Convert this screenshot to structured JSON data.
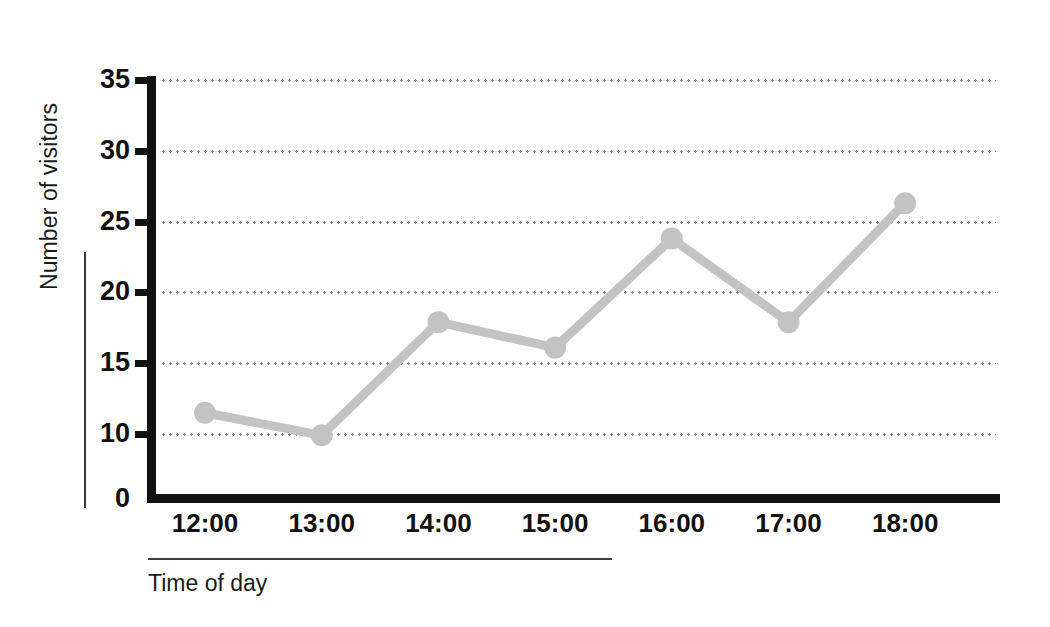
{
  "chart_data": {
    "type": "line",
    "title": "",
    "subtitle": "",
    "xlabel": "Time of day",
    "ylabel": "Number of visitors",
    "categories": [
      "12:00",
      "13:00",
      "14:00",
      "15:00",
      "16:00",
      "17:00",
      "18:00"
    ],
    "series": [
      {
        "name": "Number of visitors",
        "values": [
          11.5,
          9.8,
          17.9,
          16.1,
          23.8,
          17.9,
          26.3
        ],
        "color": "#c3c3c3",
        "marker": "circle"
      }
    ],
    "ylim": [
      0,
      35
    ],
    "y_ticks": [
      0,
      10,
      15,
      20,
      25,
      30,
      35
    ],
    "y_tick_labels": [
      "0",
      "10",
      "15",
      "20",
      "25",
      "30",
      "35"
    ],
    "y_axis_broken": true,
    "x_tick_labels": [
      "12:00",
      "13:00",
      "14:00",
      "15:00",
      "16:00",
      "17:00",
      "18:00"
    ],
    "grid": true,
    "grid_style": "dotted-horizontal",
    "legend": "none",
    "annotations": []
  },
  "axis": {
    "y_title": "Number of visitors",
    "x_title": "Time of day"
  },
  "colors": {
    "line": "#c3c3c3",
    "marker": "#c3c3c3",
    "axis": "#111111",
    "grid": "#8c8c8c",
    "text": "#111111",
    "background": "#ffffff"
  }
}
